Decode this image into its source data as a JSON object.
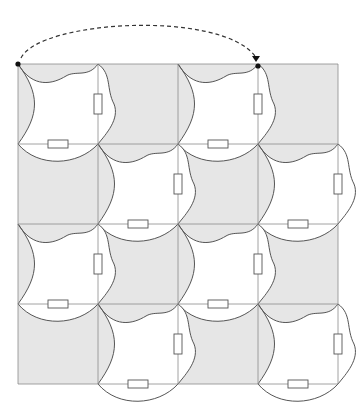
{
  "diagram": {
    "grid": {
      "rows": 4,
      "cols": 4,
      "origin": [
        18,
        64
      ],
      "cell": 80
    },
    "colors": {
      "background_cells": "#e6e6e6",
      "tiles": "#ffffff",
      "outline": "#555555",
      "grid_lines": "#8a8a8a",
      "nodes": "#111111"
    },
    "white_tiles": [
      {
        "row": 0,
        "col": 0
      },
      {
        "row": 0,
        "col": 2
      },
      {
        "row": 1,
        "col": 1
      },
      {
        "row": 1,
        "col": 3
      },
      {
        "row": 2,
        "col": 0
      },
      {
        "row": 2,
        "col": 2
      },
      {
        "row": 3,
        "col": 1
      },
      {
        "row": 3,
        "col": 3
      }
    ],
    "marked_nodes": [
      {
        "name": "start",
        "x": 18,
        "y": 64
      },
      {
        "name": "end",
        "x": 258,
        "y": 66
      }
    ],
    "translation_arrow": {
      "from": "start",
      "to": "end",
      "style": "dashed",
      "direction": "left-to-right"
    }
  }
}
